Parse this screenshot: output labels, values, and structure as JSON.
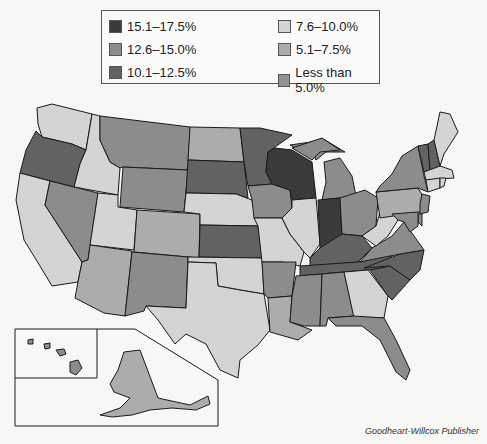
{
  "legend": {
    "items": [
      {
        "label": "15.1–17.5%",
        "color": "#3a3a3a"
      },
      {
        "label": "12.6–15.0%",
        "color": "#8c8c8c"
      },
      {
        "label": "10.1–12.5%",
        "color": "#626262"
      },
      {
        "label": "7.6–10.0%",
        "color": "#d4d4d4"
      },
      {
        "label": "5.1–7.5%",
        "color": "#acacac"
      },
      {
        "label": "Less than 5.0%",
        "color": "#929292"
      }
    ]
  },
  "map": {
    "title": "United States choropleth map",
    "states": {
      "WA": "7.6–10.0%",
      "OR": "10.1–12.5%",
      "CA": "7.6–10.0%",
      "ID": "7.6–10.0%",
      "NV": "12.6–15.0%",
      "UT": "7.6–10.0%",
      "AZ": "5.1–7.5%",
      "MT": "12.6–15.0%",
      "WY": "12.6–15.0%",
      "CO": "5.1–7.5%",
      "NM": "12.6–15.0%",
      "ND": "5.1–7.5%",
      "SD": "10.1–12.5%",
      "NE": "7.6–10.0%",
      "KS": "10.1–12.5%",
      "OK": "7.6–10.0%",
      "TX": "7.6–10.0%",
      "MN": "10.1–12.5%",
      "IA": "12.6–15.0%",
      "MO": "7.6–10.0%",
      "AR": "12.6–15.0%",
      "LA": "5.1–7.5%",
      "WI": "15.1–17.5%",
      "IL": "7.6–10.0%",
      "MI": "12.6–15.0%",
      "IN": "15.1–17.5%",
      "OH": "12.6–15.0%",
      "KY": "10.1–12.5%",
      "TN": "10.1–12.5%",
      "MS": "12.6–15.0%",
      "AL": "12.6–15.0%",
      "GA": "7.6–10.0%",
      "FL": "12.6–15.0%",
      "SC": "10.1–12.5%",
      "NC": "10.1–12.5%",
      "VA": "12.6–15.0%",
      "WV": "7.6–10.0%",
      "PA": "5.1–7.5%",
      "NY": "12.6–15.0%",
      "VT": "10.1–12.5%",
      "NH": "10.1–12.5%",
      "ME": "7.6–10.0%",
      "MA": "7.6–10.0%",
      "CT": "7.6–10.0%",
      "RI": "7.6–10.0%",
      "NJ": "12.6–15.0%",
      "DE": "12.6–15.0%",
      "MD": "12.6–15.0%",
      "AK": "5.1–7.5%",
      "HI": "12.6–15.0%"
    }
  },
  "credit": "Goodheart-Willcox Publisher"
}
